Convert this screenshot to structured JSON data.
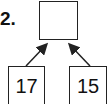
{
  "problem": {
    "number": "2.",
    "top_box": "",
    "left_box": "17",
    "right_box": "15"
  }
}
